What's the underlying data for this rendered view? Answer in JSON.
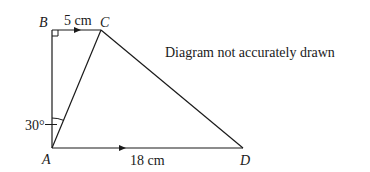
{
  "diagram": {
    "note": "Diagram not accurately drawn",
    "points": {
      "A": {
        "label": "A",
        "x": 52,
        "y": 148
      },
      "B": {
        "label": "B",
        "x": 52,
        "y": 30
      },
      "C": {
        "label": "C",
        "x": 101,
        "y": 30
      },
      "D": {
        "label": "D",
        "x": 243,
        "y": 148
      }
    },
    "measurements": {
      "BC": "5 cm",
      "AD": "18 cm",
      "angle_BAC": "30°"
    },
    "colors": {
      "line": "#1a1a1a",
      "background": "#ffffff"
    }
  }
}
